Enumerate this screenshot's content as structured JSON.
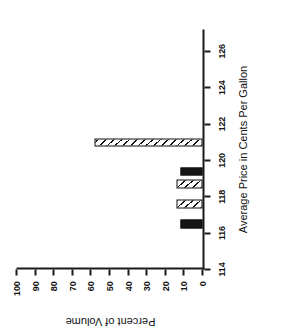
{
  "chart_data": {
    "type": "bar",
    "title": "",
    "xlabel": "Average Price in Cents Per Gallon",
    "ylabel": "Percent of Volume",
    "xlim": [
      114,
      127.2
    ],
    "ylim": [
      0,
      100
    ],
    "grid": false,
    "legend": "none",
    "orientation": "page-rotated-90-counterclockwise",
    "xticks": [
      114,
      116,
      118,
      120,
      122,
      124,
      126
    ],
    "xtick_labels": [
      "114",
      "116",
      "118",
      "120",
      "122",
      "124",
      "126"
    ],
    "yticks": [
      0,
      10,
      20,
      30,
      40,
      50,
      60,
      70,
      80,
      90,
      100
    ],
    "ytick_labels": [
      "0",
      "10",
      "20",
      "30",
      "40",
      "50",
      "60",
      "70",
      "80",
      "90",
      "100"
    ],
    "bars": [
      {
        "x": 116.5,
        "value": 12,
        "fill": "solid",
        "label": "116.5"
      },
      {
        "x": 117.6,
        "value": 14,
        "fill": "hatch",
        "label": "117.6"
      },
      {
        "x": 118.7,
        "value": 14,
        "fill": "hatch",
        "label": "118.7"
      },
      {
        "x": 119.4,
        "value": 12,
        "fill": "solid",
        "label": "119.4"
      },
      {
        "x": 121.0,
        "value": 58,
        "fill": "hatch",
        "label": "121.0"
      }
    ],
    "bar_width": 0.45
  }
}
